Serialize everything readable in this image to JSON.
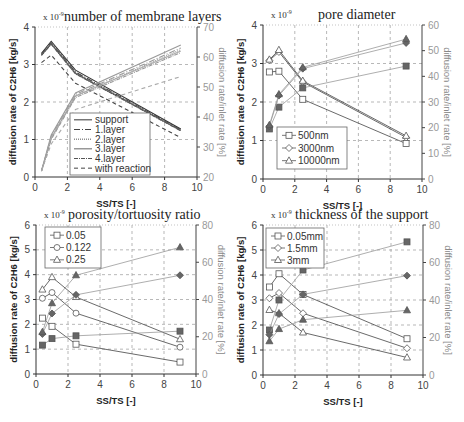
{
  "chart_data": [
    {
      "id": "layers",
      "type": "line",
      "title": "number of membrane layers",
      "scale_label": "x 10",
      "scale_exp": "-9",
      "ylabel": "diffusion rate of C2H6 [kg/s]",
      "y2label": "diffusion rate/inlet rate [%]",
      "xlabel": "SS/TS  [-]",
      "xlim": [
        0,
        10
      ],
      "ylim": [
        0,
        4
      ],
      "y2lim": [
        20,
        70
      ],
      "xticks": [
        0,
        2,
        4,
        6,
        8,
        10
      ],
      "yticks": [
        0,
        1,
        2,
        3,
        4
      ],
      "y2ticks": [
        20,
        30,
        40,
        50,
        60,
        70
      ],
      "px": {
        "x0": 35,
        "x1": 197,
        "y0": 177,
        "y1": 27
      },
      "legend": {
        "x": 70,
        "y": 113,
        "w": 80,
        "h": 62
      },
      "series": [
        {
          "name": "support",
          "dash": "",
          "color": "#333",
          "axis": "left",
          "x": [
            0.4,
            1.0,
            2.5,
            9.0
          ],
          "y": [
            3.3,
            3.62,
            2.85,
            1.28
          ]
        },
        {
          "name": "1.layer",
          "dash": "6,2,1,2",
          "color": "#444",
          "axis": "left",
          "x": [
            0.4,
            1.0,
            2.5,
            9.0
          ],
          "y": [
            3.28,
            3.58,
            2.8,
            1.26
          ]
        },
        {
          "name": "2.layer",
          "dash": "1,1",
          "color": "#555",
          "axis": "left",
          "x": [
            0.4,
            1.0,
            2.5,
            9.0
          ],
          "y": [
            3.26,
            3.56,
            2.78,
            1.25
          ]
        },
        {
          "name": "3.layer",
          "dash": "",
          "color": "#666",
          "axis": "left",
          "x": [
            0.4,
            1.0,
            2.5,
            9.0
          ],
          "y": [
            3.25,
            3.55,
            2.76,
            1.24
          ]
        },
        {
          "name": "4.layer",
          "dash": "4,1,1,1",
          "color": "#555",
          "axis": "left",
          "x": [
            0.4,
            1.0,
            2.5,
            9.0
          ],
          "y": [
            3.24,
            3.54,
            2.75,
            1.23
          ]
        },
        {
          "name": "with reaction",
          "dash": "4,3",
          "color": "#444",
          "axis": "left",
          "x": [
            0.4,
            1.0,
            2.5,
            9.0
          ],
          "y": [
            3.05,
            3.25,
            2.5,
            1.05
          ]
        },
        {
          "name": "support %",
          "dash": "",
          "color": "#999",
          "axis": "right",
          "x": [
            0.4,
            1.0,
            2.5,
            9.0
          ],
          "y": [
            22,
            34,
            48,
            64
          ]
        },
        {
          "name": "1.layer %",
          "dash": "6,2,1,2",
          "color": "#999",
          "axis": "right",
          "x": [
            0.4,
            1.0,
            2.5,
            9.0
          ],
          "y": [
            22,
            33.5,
            47.5,
            63
          ]
        },
        {
          "name": "2.layer %",
          "dash": "1,1",
          "color": "#999",
          "axis": "right",
          "x": [
            0.4,
            1.0,
            2.5,
            9.0
          ],
          "y": [
            22,
            33,
            47,
            62.5
          ]
        },
        {
          "name": "3.layer %",
          "dash": "",
          "color": "#aaa",
          "axis": "right",
          "x": [
            0.4,
            1.0,
            2.5,
            9.0
          ],
          "y": [
            22,
            33,
            47,
            62
          ]
        },
        {
          "name": "4.layer %",
          "dash": "4,1,1,1",
          "color": "#999",
          "axis": "right",
          "x": [
            0.4,
            1.0,
            2.5,
            9.0
          ],
          "y": [
            22,
            32.5,
            46.5,
            61.5
          ]
        },
        {
          "name": "with reaction %",
          "dash": "4,3",
          "color": "#aaa",
          "axis": "right",
          "x": [
            0.4,
            1.0,
            2.5,
            9.0
          ],
          "y": [
            22,
            31,
            42.5,
            53.5
          ]
        }
      ],
      "legend_items": [
        "support",
        "1.layer",
        "2.layer",
        "3.layer",
        "4.layer",
        "with reaction"
      ]
    },
    {
      "id": "pore",
      "type": "line",
      "title": "pore diameter",
      "scale_label": "x 10",
      "scale_exp": "-9",
      "ylabel": "diffusion rate of C2H6 [kg/s]",
      "y2label": "diffusion rate/inlet rate [%]",
      "xlabel": "SS/TS  [-]",
      "xlim": [
        0,
        10
      ],
      "ylim": [
        0,
        4
      ],
      "y2lim": [
        0,
        60
      ],
      "xticks": [
        0,
        2,
        4,
        6,
        8,
        10
      ],
      "yticks": [
        0,
        1,
        2,
        3,
        4
      ],
      "y2ticks": [
        0,
        10,
        20,
        30,
        40,
        50,
        60
      ],
      "px": {
        "x0": 263,
        "x1": 422,
        "y0": 179,
        "y1": 25
      },
      "legend": {
        "x": 277,
        "y": 127,
        "w": 70,
        "h": 42
      },
      "series": [
        {
          "name": "500nm",
          "marker": "square",
          "axis": "left",
          "x": [
            0.4,
            1.0,
            2.5,
            9.0
          ],
          "y": [
            2.78,
            2.8,
            2.07,
            0.92
          ]
        },
        {
          "name": "3000nm",
          "marker": "diamond",
          "axis": "left",
          "x": [
            0.4,
            1.0,
            2.5,
            9.0
          ],
          "y": [
            3.08,
            3.3,
            2.52,
            1.08
          ]
        },
        {
          "name": "10000nm",
          "marker": "triangle",
          "axis": "left",
          "x": [
            0.4,
            1.0,
            2.5,
            9.0
          ],
          "y": [
            3.1,
            3.35,
            2.55,
            1.12
          ]
        },
        {
          "name": "500nm %",
          "marker": "square-filled",
          "axis": "right",
          "x": [
            0.4,
            1.0,
            2.5,
            9.0
          ],
          "y": [
            19.5,
            28,
            35.5,
            44
          ]
        },
        {
          "name": "3000nm %",
          "marker": "diamond-filled",
          "axis": "right",
          "x": [
            0.4,
            1.0,
            2.5,
            9.0
          ],
          "y": [
            20.5,
            32.5,
            43,
            53
          ]
        },
        {
          "name": "10000nm %",
          "marker": "triangle-filled",
          "axis": "right",
          "x": [
            0.4,
            1.0,
            2.5,
            9.0
          ],
          "y": [
            21,
            33,
            43.5,
            54.5
          ]
        }
      ],
      "legend_items": [
        "500nm",
        "3000nm",
        "10000nm"
      ],
      "legend_markers": [
        "square",
        "diamond",
        "triangle"
      ]
    },
    {
      "id": "porosity",
      "type": "line",
      "title": "porosity/tortuosity ratio",
      "scale_label": "x 10",
      "scale_exp": "-9",
      "ylabel": "diffusion rate of C2H6 [kg/s]",
      "y2label": "diffusion rate/inlet rate [%]",
      "xlabel": "SS/TS  [-]",
      "xlim": [
        0,
        10
      ],
      "ylim": [
        0,
        6
      ],
      "y2lim": [
        0,
        80
      ],
      "xticks": [
        0,
        2,
        4,
        6,
        8,
        10
      ],
      "yticks": [
        0,
        1,
        2,
        3,
        4,
        5,
        6
      ],
      "y2ticks": [
        0,
        20,
        40,
        60,
        80
      ],
      "px": {
        "x0": 36,
        "x1": 196,
        "y0": 374,
        "y1": 225
      },
      "legend": {
        "x": 45,
        "y": 227,
        "w": 56,
        "h": 41
      },
      "series": [
        {
          "name": "0.05",
          "marker": "square",
          "axis": "left",
          "x": [
            0.4,
            1.0,
            2.5,
            9.0
          ],
          "y": [
            2.25,
            1.92,
            1.2,
            0.48
          ]
        },
        {
          "name": "0.122",
          "marker": "circle",
          "axis": "left",
          "x": [
            0.4,
            1.0,
            2.5,
            9.0
          ],
          "y": [
            3.05,
            3.28,
            2.45,
            1.08
          ]
        },
        {
          "name": "0.25",
          "marker": "triangle",
          "axis": "left",
          "x": [
            0.4,
            1.0,
            2.5,
            9.0
          ],
          "y": [
            3.4,
            3.9,
            3.1,
            1.4
          ]
        },
        {
          "name": "0.05 %",
          "marker": "square-filled",
          "axis": "right",
          "x": [
            0.4,
            1.0,
            2.5,
            9.0
          ],
          "y": [
            15.5,
            19,
            20.5,
            23
          ]
        },
        {
          "name": "0.122 %",
          "marker": "diamond-filled",
          "axis": "right",
          "x": [
            0.4,
            1.0,
            2.5,
            9.0
          ],
          "y": [
            21.5,
            32.5,
            42.5,
            53
          ]
        },
        {
          "name": "0.25 %",
          "marker": "triangle-filled",
          "axis": "right",
          "x": [
            0.4,
            1.0,
            2.5,
            9.0
          ],
          "y": [
            22.5,
            38,
            53,
            68
          ]
        }
      ],
      "legend_items": [
        "0.05",
        "0.122",
        "0.25"
      ],
      "legend_markers": [
        "square",
        "circle",
        "triangle"
      ]
    },
    {
      "id": "thickness",
      "type": "line",
      "title": "thickness of the support",
      "scale_label": "x 10",
      "scale_exp": "-9",
      "ylabel": "diffusion rate of C2H6 [kg/s]",
      "y2label": "diffusion rate/inlet rate [%]",
      "xlabel": "SS/TS  [-]",
      "xlim": [
        0,
        10
      ],
      "ylim": [
        0,
        6
      ],
      "y2lim": [
        0,
        80
      ],
      "xticks": [
        0,
        2,
        4,
        6,
        8,
        10
      ],
      "yticks": [
        0,
        1,
        2,
        3,
        4,
        5,
        6
      ],
      "y2ticks": [
        0,
        20,
        40,
        60,
        80
      ],
      "px": {
        "x0": 263,
        "x1": 423,
        "y0": 375,
        "y1": 225
      },
      "legend": {
        "x": 266,
        "y": 228,
        "w": 58,
        "h": 40
      },
      "series": [
        {
          "name": "0.05mm",
          "marker": "square",
          "axis": "left",
          "x": [
            0.4,
            1.0,
            2.5,
            9.0
          ],
          "y": [
            3.52,
            4.05,
            3.22,
            1.45
          ]
        },
        {
          "name": "1.5mm",
          "marker": "diamond",
          "axis": "left",
          "x": [
            0.4,
            1.0,
            2.5,
            9.0
          ],
          "y": [
            3.07,
            3.28,
            2.47,
            1.07
          ]
        },
        {
          "name": "3mm",
          "marker": "triangle",
          "axis": "left",
          "x": [
            0.4,
            1.0,
            2.5,
            9.0
          ],
          "y": [
            2.6,
            2.47,
            1.7,
            0.7
          ]
        },
        {
          "name": "0.05mm %",
          "marker": "square-filled",
          "axis": "right",
          "x": [
            0.4,
            1.0,
            2.5,
            9.0
          ],
          "y": [
            24,
            40,
            56,
            71
          ]
        },
        {
          "name": "1.5mm %",
          "marker": "diamond-filled",
          "axis": "right",
          "x": [
            0.4,
            1.0,
            2.5,
            9.0
          ],
          "y": [
            21.5,
            32.5,
            43,
            53
          ]
        },
        {
          "name": "3mm %",
          "marker": "triangle-filled",
          "axis": "right",
          "x": [
            0.4,
            1.0,
            2.5,
            9.0
          ],
          "y": [
            18,
            24.5,
            29.5,
            34.5
          ]
        }
      ],
      "legend_items": [
        "0.05mm",
        "1.5mm",
        "3mm"
      ],
      "legend_markers": [
        "square",
        "diamond",
        "triangle"
      ]
    }
  ]
}
